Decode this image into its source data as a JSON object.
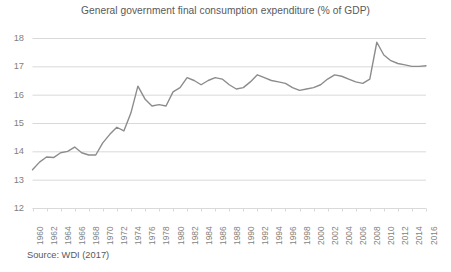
{
  "figure": {
    "title": "General government final consumption expenditure (% of GDP)",
    "source_note": "Source: WDI (2017)"
  },
  "style": {
    "line_color": "#8c8c8c",
    "grid_color": "#d9d9d9",
    "axis_color": "#d9d9d9",
    "text_color": "#595959",
    "tick_color": "#7f7f7f",
    "background": "#ffffff"
  },
  "chart_data": {
    "type": "line",
    "title": "General government final consumption expenditure (% of GDP)",
    "xlabel": "",
    "ylabel": "",
    "ylim": [
      12,
      18
    ],
    "xlim": [
      1960,
      2016
    ],
    "yticks": [
      12,
      13,
      14,
      15,
      16,
      17,
      18
    ],
    "xticks": [
      1960,
      1962,
      1964,
      1966,
      1968,
      1970,
      1972,
      1974,
      1976,
      1978,
      1980,
      1982,
      1984,
      1986,
      1988,
      1990,
      1992,
      1994,
      1996,
      1998,
      2000,
      2002,
      2004,
      2006,
      2008,
      2010,
      2012,
      2014,
      2016
    ],
    "grid": true,
    "grid_axis": "y",
    "legend": false,
    "markers": false,
    "x": [
      1960,
      1961,
      1962,
      1963,
      1964,
      1965,
      1966,
      1967,
      1968,
      1969,
      1970,
      1971,
      1972,
      1973,
      1974,
      1975,
      1976,
      1977,
      1978,
      1979,
      1980,
      1981,
      1982,
      1983,
      1984,
      1985,
      1986,
      1987,
      1988,
      1989,
      1990,
      1991,
      1992,
      1993,
      1994,
      1995,
      1996,
      1997,
      1998,
      1999,
      2000,
      2001,
      2002,
      2003,
      2004,
      2005,
      2006,
      2007,
      2008,
      2009,
      2010,
      2011,
      2012,
      2013,
      2014,
      2015,
      2016
    ],
    "values": [
      13.35,
      13.62,
      13.8,
      13.78,
      13.95,
      14.0,
      14.15,
      13.95,
      13.87,
      13.87,
      14.3,
      14.6,
      14.85,
      14.72,
      15.35,
      16.3,
      15.85,
      15.6,
      15.65,
      15.6,
      16.1,
      16.25,
      16.6,
      16.5,
      16.35,
      16.5,
      16.6,
      16.55,
      16.35,
      16.2,
      16.25,
      16.45,
      16.7,
      16.6,
      16.5,
      16.45,
      16.4,
      16.25,
      16.15,
      16.2,
      16.25,
      16.35,
      16.55,
      16.7,
      16.65,
      16.55,
      16.45,
      16.4,
      16.55,
      17.85,
      17.4,
      17.2,
      17.1,
      17.05,
      17.0,
      17.0,
      17.02
    ],
    "series": [
      {
        "name": "General government final consumption expenditure (% of GDP)",
        "color": "#8c8c8c",
        "values": [
          13.35,
          13.62,
          13.8,
          13.78,
          13.95,
          14.0,
          14.15,
          13.95,
          13.87,
          13.87,
          14.3,
          14.6,
          14.85,
          14.72,
          15.35,
          16.3,
          15.85,
          15.6,
          15.65,
          15.6,
          16.1,
          16.25,
          16.6,
          16.5,
          16.35,
          16.5,
          16.6,
          16.55,
          16.35,
          16.2,
          16.25,
          16.45,
          16.7,
          16.6,
          16.5,
          16.45,
          16.4,
          16.25,
          16.15,
          16.2,
          16.25,
          16.35,
          16.55,
          16.7,
          16.65,
          16.55,
          16.45,
          16.4,
          16.55,
          17.85,
          17.4,
          17.2,
          17.1,
          17.05,
          17.0,
          17.0,
          17.02
        ]
      }
    ]
  }
}
